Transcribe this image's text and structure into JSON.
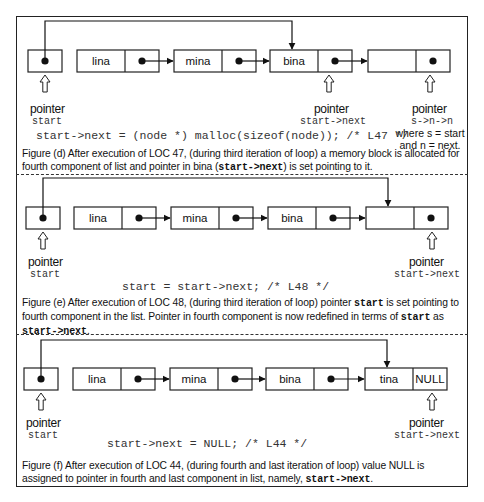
{
  "panels": {
    "d": {
      "nodes": [
        {
          "data": "lina",
          "next": "pointer"
        },
        {
          "data": "mina",
          "next": "pointer"
        },
        {
          "data": "bina",
          "next": "pointer"
        },
        {
          "data": "",
          "next": "pointer"
        }
      ],
      "start_pointer": {
        "word": "pointer",
        "name": "start"
      },
      "mid_pointer": {
        "word": "pointer",
        "name": "start->next"
      },
      "right_pointer": {
        "word": "pointer",
        "name": "s->n->n",
        "note_line1": "where s = start",
        "note_line2": "and n = next."
      },
      "code": "start->next = (node *) malloc(sizeof(node)); /* L47 */",
      "caption_parts": [
        "Figure (d) After execution of LOC 47, (during third iteration of loop)  a memory block is allocated for fourth component of list and pointer in bina (",
        "start->next",
        ") is set pointing to it."
      ]
    },
    "e": {
      "nodes": [
        {
          "data": "lina",
          "next": "pointer"
        },
        {
          "data": "mina",
          "next": "pointer"
        },
        {
          "data": "bina",
          "next": "pointer"
        },
        {
          "data": "",
          "next": "pointer"
        }
      ],
      "start_pointer": {
        "word": "pointer",
        "name": "start"
      },
      "right_pointer": {
        "word": "pointer",
        "name": "start->next"
      },
      "code": "start = start->next;   /* L48 */",
      "caption_parts": [
        "Figure (e) After execution of LOC 48, (during third iteration of loop) pointer ",
        "start",
        " is set pointing to fourth component in the list. Pointer in fourth component is now redefined in terms of ",
        "start",
        " as ",
        "start->next",
        "."
      ]
    },
    "f": {
      "nodes": [
        {
          "data": "lina",
          "next": "pointer"
        },
        {
          "data": "mina",
          "next": "pointer"
        },
        {
          "data": "bina",
          "next": "pointer"
        },
        {
          "data": "tina",
          "next": "NULL"
        }
      ],
      "start_pointer": {
        "word": "pointer",
        "name": "start"
      },
      "right_pointer": {
        "word": "pointer",
        "name": "start->next"
      },
      "code": "start->next = NULL;        /* L44 */",
      "caption_parts": [
        "Figure (f) After execution of LOC 44, (during fourth and last iteration of loop) value NULL is assigned to pointer in fourth and last component in list, namely, ",
        "start->next",
        "."
      ]
    }
  }
}
